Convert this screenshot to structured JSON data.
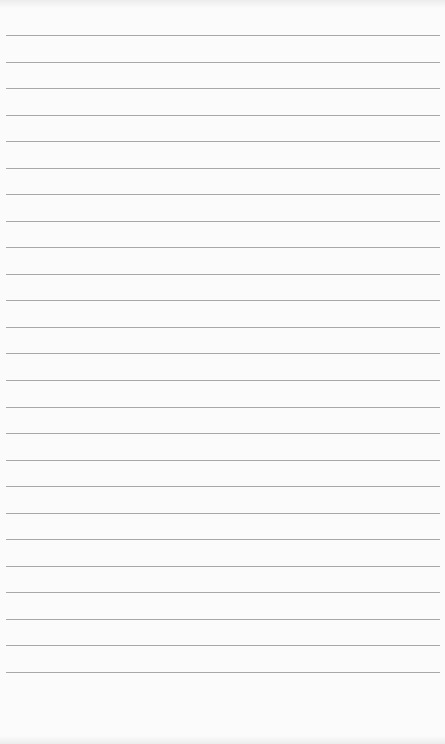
{
  "page": {
    "type": "lined-notepad",
    "line_color": "#a8a8a8",
    "background_color": "#fbfbfb",
    "line_count": 25,
    "first_line_y": 35,
    "line_spacing": 26.54
  }
}
